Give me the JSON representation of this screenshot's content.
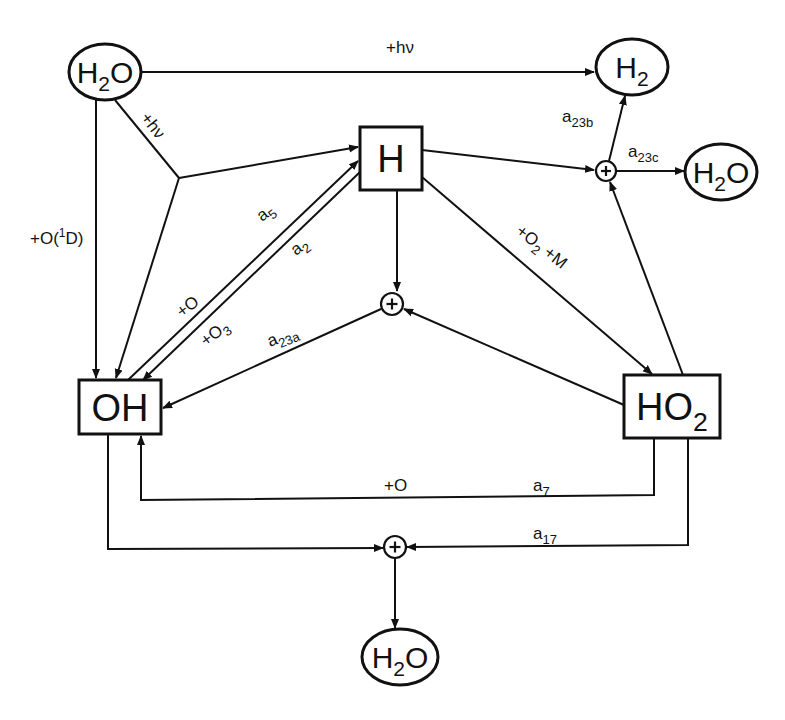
{
  "diagram": {
    "type": "reaction-network",
    "nodes": {
      "h2o_source": {
        "label": "H",
        "sub": "2",
        "tail": "O",
        "shape": "ellipse",
        "cx": 105,
        "cy": 72,
        "rx": 36,
        "ry": 28
      },
      "h2": {
        "label": "H",
        "sub": "2",
        "tail": "",
        "shape": "ellipse",
        "cx": 632,
        "cy": 67,
        "rx": 36,
        "ry": 28
      },
      "h2o_right": {
        "label": "H",
        "sub": "2",
        "tail": "O",
        "shape": "ellipse",
        "cx": 721,
        "cy": 172,
        "rx": 36,
        "ry": 28
      },
      "h2o_bottom": {
        "label": "H",
        "sub": "2",
        "tail": "O",
        "shape": "ellipse",
        "cx": 400,
        "cy": 657,
        "rx": 38,
        "ry": 28
      },
      "h": {
        "label": "H",
        "sub": "",
        "tail": "",
        "shape": "box",
        "x": 360,
        "y": 127,
        "w": 62,
        "h": 63
      },
      "oh": {
        "label": "OH",
        "sub": "",
        "tail": "",
        "shape": "box",
        "x": 79,
        "y": 380,
        "w": 82,
        "h": 54
      },
      "ho2": {
        "label": "HO",
        "sub": "2",
        "tail": "",
        "shape": "box",
        "x": 624,
        "y": 375,
        "w": 96,
        "h": 63
      }
    },
    "sum_nodes": {
      "top_right": {
        "symbol": "+",
        "cx": 606,
        "cy": 171,
        "r": 10
      },
      "middle": {
        "symbol": "+",
        "cx": 392,
        "cy": 304,
        "r": 11
      },
      "bottom": {
        "symbol": "+",
        "cx": 395,
        "cy": 547,
        "r": 11
      }
    },
    "edge_labels": {
      "h2o_to_h2": {
        "text": "+hν",
        "x": 386,
        "y": 53,
        "rotate": 0
      },
      "h2o_photolysis": {
        "text": "+hν",
        "x": 140,
        "y": 118,
        "rotate": 52
      },
      "o1d": {
        "text": "+O(",
        "sup": "1",
        "tail": "D)",
        "x": 30,
        "y": 244,
        "rotate": 0
      },
      "a5": {
        "text": "a",
        "sub": "5",
        "x": 262,
        "y": 222,
        "rotate": -38
      },
      "a2": {
        "text": "a",
        "sub": "2",
        "x": 296,
        "y": 256,
        "rotate": -38
      },
      "plus_o": {
        "text": "+O",
        "x": 182,
        "y": 318,
        "rotate": -38
      },
      "plus_o3": {
        "text": "+O",
        "sub": "3",
        "x": 206,
        "y": 347,
        "rotate": -38
      },
      "a23a": {
        "text": "a",
        "sub": "23a",
        "x": 270,
        "y": 347,
        "rotate": -22
      },
      "a23b": {
        "text": "a",
        "sub": "23b",
        "x": 562,
        "y": 122,
        "rotate": 0
      },
      "a23c": {
        "text": "a",
        "sub": "23c",
        "x": 628,
        "y": 157,
        "rotate": 0
      },
      "o2_m": {
        "text": "+O",
        "sub": "2",
        "tail": " +M",
        "x": 515,
        "y": 233,
        "rotate": 38
      },
      "plus_o_bottom": {
        "text": "+O",
        "x": 384,
        "y": 491,
        "rotate": 0
      },
      "a7": {
        "text": "a",
        "sub": "7",
        "x": 533,
        "y": 491,
        "rotate": 0
      },
      "a17": {
        "text": "a",
        "sub": "17",
        "x": 533,
        "y": 539,
        "rotate": 0
      }
    },
    "edges": [
      {
        "id": "h2o-to-h2",
        "points": [
          [
            141,
            72
          ],
          [
            594,
            72
          ]
        ],
        "arrow": "end"
      },
      {
        "id": "h2o-to-oh-o1d",
        "points": [
          [
            96,
            100
          ],
          [
            96,
            378
          ]
        ],
        "arrow": "end"
      },
      {
        "id": "h2o-to-junction",
        "points": [
          [
            115,
            100
          ],
          [
            179,
            178
          ]
        ],
        "arrow": "none"
      },
      {
        "id": "junction-to-h",
        "points": [
          [
            179,
            178
          ],
          [
            358,
            147
          ]
        ],
        "arrow": "end"
      },
      {
        "id": "junction-to-oh",
        "points": [
          [
            179,
            178
          ],
          [
            116,
            378
          ]
        ],
        "arrow": "end"
      },
      {
        "id": "oh-to-h-a5",
        "points": [
          [
            128,
            380
          ],
          [
            358,
            161
          ]
        ],
        "arrow": "end"
      },
      {
        "id": "h-to-oh-a2",
        "points": [
          [
            360,
            172
          ],
          [
            143,
            380
          ]
        ],
        "arrow": "end"
      },
      {
        "id": "h-to-plus-top-right",
        "points": [
          [
            422,
            150
          ],
          [
            594,
            170
          ]
        ],
        "arrow": "end"
      },
      {
        "id": "plus-to-h2-a23b",
        "points": [
          [
            609,
            161
          ],
          [
            625,
            96
          ]
        ],
        "arrow": "end"
      },
      {
        "id": "plus-to-h2o-a23c",
        "points": [
          [
            616,
            171
          ],
          [
            684,
            171
          ]
        ],
        "arrow": "end"
      },
      {
        "id": "ho2-to-plus-top-right",
        "points": [
          [
            683,
            375
          ],
          [
            610,
            182
          ]
        ],
        "arrow": "end"
      },
      {
        "id": "h-to-ho2",
        "points": [
          [
            422,
            177
          ],
          [
            652,
            374
          ]
        ],
        "arrow": "end"
      },
      {
        "id": "h-to-plus-middle",
        "points": [
          [
            397,
            190
          ],
          [
            397,
            291
          ]
        ],
        "arrow": "end"
      },
      {
        "id": "ho2-to-plus-middle",
        "points": [
          [
            624,
            405
          ],
          [
            404,
            309
          ]
        ],
        "arrow": "end"
      },
      {
        "id": "plus-middle-to-oh-a23a",
        "points": [
          [
            381,
            309
          ],
          [
            163,
            408
          ]
        ],
        "arrow": "end"
      },
      {
        "id": "ho2-to-oh-a7",
        "points": [
          [
            654,
            438
          ],
          [
            654,
            495
          ],
          [
            141,
            500
          ],
          [
            141,
            436
          ]
        ],
        "arrow": "end"
      },
      {
        "id": "oh-to-plus-bottom",
        "points": [
          [
            108,
            434
          ],
          [
            108,
            549
          ],
          [
            383,
            548
          ]
        ],
        "arrow": "end"
      },
      {
        "id": "ho2-to-plus-bottom",
        "points": [
          [
            688,
            438
          ],
          [
            688,
            545
          ],
          [
            407,
            547
          ]
        ],
        "arrow": "end"
      },
      {
        "id": "plus-bottom-to-h2o",
        "points": [
          [
            395,
            558
          ],
          [
            395,
            628
          ]
        ],
        "arrow": "end"
      }
    ]
  }
}
